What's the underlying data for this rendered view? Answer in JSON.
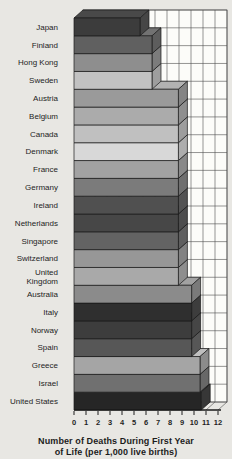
{
  "figure": {
    "background": "#e8e7e3",
    "wall_color": "#fcfcf9",
    "grid_color": "#4d4d4d",
    "outline_color": "#1a1a1a",
    "label_color": "#242424",
    "tick_color": "#1f1f1f",
    "caption_line1": "Number of Deaths During First Year",
    "caption_line2": "of Life (per 1,000 live births)"
  },
  "chart_data": {
    "type": "bar",
    "orientation": "horizontal",
    "title": "Number of Deaths During First Year of Life (per 1,000 live births)",
    "xlabel": "Number of Deaths During First Year of Life (per 1,000 live births)",
    "ylabel": "",
    "xlim": [
      0,
      12
    ],
    "xticks": [
      0,
      1,
      2,
      3,
      4,
      5,
      6,
      7,
      8,
      9,
      10,
      11,
      12
    ],
    "grid": true,
    "legend": false,
    "categories": [
      "Japan",
      "Finland",
      "Hong Kong",
      "Sweden",
      "Austria",
      "Belgium",
      "Canada",
      "Denmark",
      "France",
      "Germany",
      "Ireland",
      "Netherlands",
      "Singapore",
      "Switzerland",
      "United Kingdom",
      "Australia",
      "Italy",
      "Norway",
      "Spain",
      "Greece",
      "Israel",
      "United States"
    ],
    "values": [
      5.5,
      6.5,
      6.5,
      6.5,
      8.7,
      8.7,
      8.7,
      8.7,
      8.7,
      8.7,
      8.7,
      8.7,
      8.7,
      8.7,
      8.7,
      9.8,
      9.8,
      9.8,
      9.8,
      10.5,
      10.5,
      10.6
    ],
    "bar_colors": [
      "#3c3c3c",
      "#606060",
      "#8e8e8e",
      "#c2c2c2",
      "#9a9a9a",
      "#ababab",
      "#c0c0c0",
      "#d8d8d8",
      "#a2a2a2",
      "#7b7b7b",
      "#505050",
      "#474747",
      "#636363",
      "#979797",
      "#a9a9a9",
      "#8b8b8b",
      "#2f2f2f",
      "#3d3d3d",
      "#575757",
      "#a5a5a5",
      "#707070",
      "#262626"
    ]
  }
}
